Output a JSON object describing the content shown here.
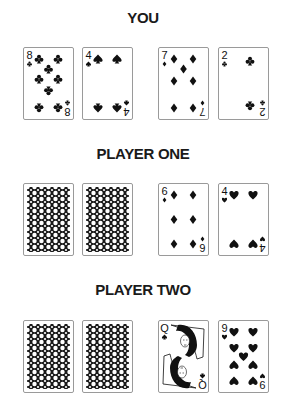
{
  "sections": [
    {
      "title": "YOU",
      "cards": [
        {
          "rank": "8",
          "suit": "clubs",
          "face": "up"
        },
        {
          "rank": "4",
          "suit": "spades",
          "face": "up"
        },
        {
          "rank": "7",
          "suit": "diamonds",
          "face": "up"
        },
        {
          "rank": "2",
          "suit": "clubs",
          "face": "up"
        }
      ]
    },
    {
      "title": "PLAYER ONE",
      "cards": [
        {
          "face": "down"
        },
        {
          "face": "down"
        },
        {
          "rank": "6",
          "suit": "diamonds",
          "face": "up"
        },
        {
          "rank": "4",
          "suit": "hearts",
          "face": "up"
        }
      ]
    },
    {
      "title": "PLAYER TWO",
      "cards": [
        {
          "face": "down"
        },
        {
          "face": "down"
        },
        {
          "rank": "Q",
          "suit": "spades",
          "face": "up"
        },
        {
          "rank": "9",
          "suit": "hearts",
          "face": "up"
        }
      ]
    }
  ],
  "colors": {
    "ink": "#111111",
    "card_border": "#9a9a9a",
    "background": "#ffffff"
  }
}
